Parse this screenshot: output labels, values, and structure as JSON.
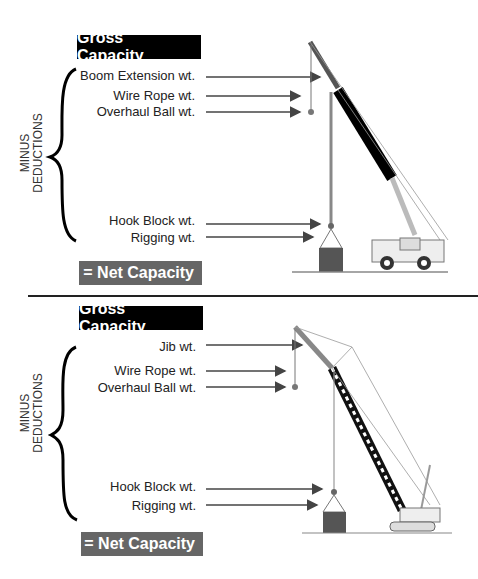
{
  "top": {
    "gross_label": "Gross Capacity",
    "side_label_line1": "MINUS",
    "side_label_line2": "DEDUCTIONS",
    "items": [
      "Boom Extension wt.",
      "Wire Rope wt.",
      "Overhaul Ball wt.",
      "Hook Block wt.",
      "Rigging wt."
    ],
    "net_label": "= Net Capacity",
    "crane_type": "telescopic-rough-terrain-crane"
  },
  "bottom": {
    "gross_label": "Gross Capacity",
    "side_label_line1": "MINUS",
    "side_label_line2": "DEDUCTIONS",
    "items": [
      "Jib wt.",
      "Wire Rope wt.",
      "Overhaul Ball wt.",
      "Hook Block wt.",
      "Rigging wt."
    ],
    "net_label": "= Net Capacity",
    "crane_type": "lattice-crawler-crane"
  },
  "colors": {
    "gross_bg": "#000000",
    "net_bg": "#666666",
    "arrow": "#444444",
    "load": "#555555"
  }
}
